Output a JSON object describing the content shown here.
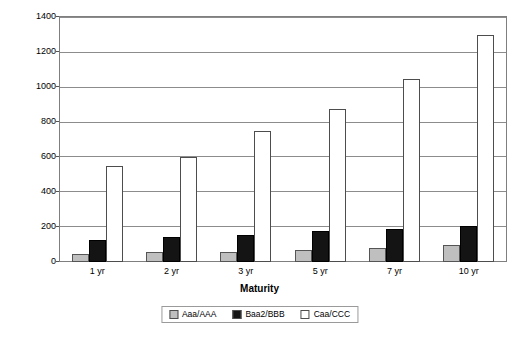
{
  "chart_data": {
    "type": "bar",
    "title": "",
    "xlabel": "Maturity",
    "ylabel": "",
    "categories": [
      "1 yr",
      "2 yr",
      "3 yr",
      "5 yr",
      "7 yr",
      "10 yr"
    ],
    "series": [
      {
        "name": "Aaa/AAA",
        "color": "#bfbfbf",
        "values": [
          45,
          55,
          60,
          70,
          80,
          95
        ]
      },
      {
        "name": "Baa2/BBB",
        "color": "#141414",
        "values": [
          125,
          145,
          155,
          180,
          190,
          205
        ]
      },
      {
        "name": "Caa/CCC",
        "color": "#ffffff",
        "values": [
          550,
          600,
          750,
          880,
          1050,
          1300
        ]
      }
    ],
    "ylim": [
      0,
      1400
    ],
    "ytick_step": 200,
    "yticks": [
      0,
      200,
      400,
      600,
      800,
      1000,
      1200,
      1400
    ],
    "ytick_labels": [
      "0",
      "200",
      "400",
      "600",
      "800",
      "1000",
      "1200",
      "1400"
    ],
    "grid": true,
    "legend_position": "bottom"
  },
  "legend": {
    "items": [
      {
        "label": "Aaa/AAA",
        "swatch": "#bfbfbf"
      },
      {
        "label": "Baa2/BBB",
        "swatch": "#141414"
      },
      {
        "label": "Caa/CCC",
        "swatch": "#ffffff"
      }
    ]
  }
}
